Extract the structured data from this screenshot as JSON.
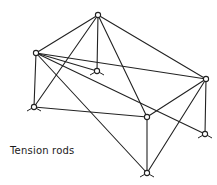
{
  "diagram": {
    "title_label": "Tension rods",
    "label_pos": {
      "x": 10,
      "y": 145
    },
    "stroke_color": "#222222",
    "background": "#ffffff",
    "nodes": [
      {
        "id": "T",
        "name": "apex-top",
        "x": 98,
        "y": 15,
        "feet": false
      },
      {
        "id": "L",
        "name": "upper-left",
        "x": 36,
        "y": 53,
        "feet": false
      },
      {
        "id": "C",
        "name": "center-back",
        "x": 97,
        "y": 71,
        "feet": true
      },
      {
        "id": "R",
        "name": "right",
        "x": 206,
        "y": 79,
        "feet": false
      },
      {
        "id": "LL",
        "name": "lower-left",
        "x": 34,
        "y": 107,
        "feet": true
      },
      {
        "id": "M",
        "name": "middle-front",
        "x": 147,
        "y": 117,
        "feet": false
      },
      {
        "id": "RL",
        "name": "lower-right",
        "x": 205,
        "y": 134,
        "feet": true
      },
      {
        "id": "B",
        "name": "bottom",
        "x": 147,
        "y": 173,
        "feet": true
      }
    ],
    "edges": [
      [
        "T",
        "L"
      ],
      [
        "T",
        "LL"
      ],
      [
        "T",
        "C"
      ],
      [
        "T",
        "M"
      ],
      [
        "T",
        "R"
      ],
      [
        "L",
        "R"
      ],
      [
        "L",
        "C"
      ],
      [
        "L",
        "RL"
      ],
      [
        "L",
        "B"
      ],
      [
        "L",
        "LL"
      ],
      [
        "LL",
        "M"
      ],
      [
        "M",
        "R"
      ],
      [
        "M",
        "B"
      ],
      [
        "R",
        "RL"
      ],
      [
        "R",
        "B"
      ]
    ]
  }
}
